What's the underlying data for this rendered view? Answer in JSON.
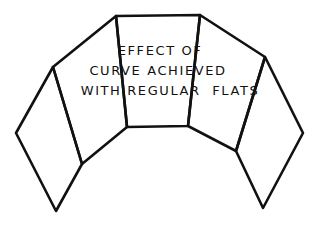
{
  "diagram": {
    "caption_lines": [
      "EFFECT OF",
      "CURVE ACHIEVED",
      "WITH REGULAR  FLATS"
    ],
    "panels": [
      {
        "name": "far-left-flat",
        "points": [
          [
            53,
            67
          ],
          [
            16,
            133
          ],
          [
            56,
            211
          ],
          [
            82,
            164
          ]
        ]
      },
      {
        "name": "left-flat",
        "points": [
          [
            53,
            67
          ],
          [
            116,
            16
          ],
          [
            127,
            127
          ],
          [
            82,
            164
          ]
        ]
      },
      {
        "name": "center-flat",
        "points": [
          [
            116,
            16
          ],
          [
            200,
            15
          ],
          [
            188,
            126
          ],
          [
            127,
            127
          ]
        ]
      },
      {
        "name": "right-flat",
        "points": [
          [
            200,
            15
          ],
          [
            265,
            57
          ],
          [
            236,
            151
          ],
          [
            188,
            126
          ]
        ]
      },
      {
        "name": "far-right-flat",
        "points": [
          [
            265,
            57
          ],
          [
            303,
            133
          ],
          [
            263,
            208
          ],
          [
            236,
            151
          ]
        ]
      }
    ],
    "line_color": "#111111",
    "background": "#ffffff"
  }
}
